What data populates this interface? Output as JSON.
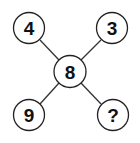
{
  "puzzle": {
    "center": "8",
    "top_left": "4",
    "top_right": "3",
    "bottom_left": "9",
    "bottom_right": "?"
  },
  "colors": {
    "stroke": "#222222",
    "text": "#111111",
    "background": "#ffffff"
  }
}
